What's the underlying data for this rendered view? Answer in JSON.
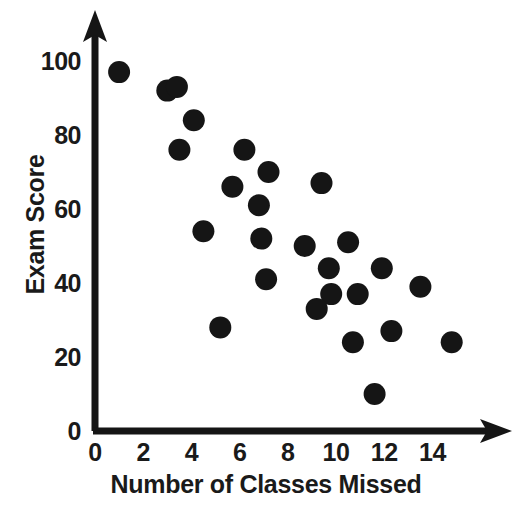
{
  "chart_data": {
    "type": "scatter",
    "title": "",
    "xlabel": "Number of Classes Missed",
    "ylabel": "Exam Score",
    "xlim": [
      0,
      15.6
    ],
    "ylim": [
      0,
      104
    ],
    "xticks": [
      0,
      2,
      4,
      6,
      8,
      10,
      12,
      14
    ],
    "yticks": [
      0,
      20,
      40,
      60,
      80,
      100
    ],
    "xtick_labels": [
      "0",
      "2",
      "4",
      "6",
      "8",
      "10",
      "12",
      "14"
    ],
    "ytick_labels": [
      "0",
      "20",
      "40",
      "60",
      "80",
      "100"
    ],
    "grid": false,
    "legend": false,
    "marker": {
      "shape": "circle",
      "color": "#151515",
      "radius_px": 11
    },
    "axis_color": "#151515",
    "axis_style": "arrow-tipped L-shaped spine",
    "points": [
      {
        "x": 1,
        "y": 97
      },
      {
        "x": 3,
        "y": 92
      },
      {
        "x": 3.4,
        "y": 93
      },
      {
        "x": 4.1,
        "y": 84
      },
      {
        "x": 3.5,
        "y": 76
      },
      {
        "x": 6.2,
        "y": 76
      },
      {
        "x": 7.2,
        "y": 70
      },
      {
        "x": 5.7,
        "y": 66
      },
      {
        "x": 6.8,
        "y": 61
      },
      {
        "x": 9.4,
        "y": 67
      },
      {
        "x": 4.5,
        "y": 54
      },
      {
        "x": 6.9,
        "y": 52
      },
      {
        "x": 8.7,
        "y": 50
      },
      {
        "x": 10.5,
        "y": 51
      },
      {
        "x": 9.7,
        "y": 44
      },
      {
        "x": 11.9,
        "y": 44
      },
      {
        "x": 7.1,
        "y": 41
      },
      {
        "x": 9.8,
        "y": 37
      },
      {
        "x": 10.9,
        "y": 37
      },
      {
        "x": 13.5,
        "y": 39
      },
      {
        "x": 9.2,
        "y": 33
      },
      {
        "x": 5.2,
        "y": 28
      },
      {
        "x": 12.3,
        "y": 27
      },
      {
        "x": 10.7,
        "y": 24
      },
      {
        "x": 14.8,
        "y": 24
      },
      {
        "x": 11.6,
        "y": 10
      }
    ]
  },
  "geometry": {
    "origin_px": {
      "x": 95,
      "y": 431
    },
    "px_per_x_unit": 24.1,
    "px_per_y_unit": 3.7,
    "x_axis_end_px": 510,
    "y_axis_top_px": 20
  }
}
